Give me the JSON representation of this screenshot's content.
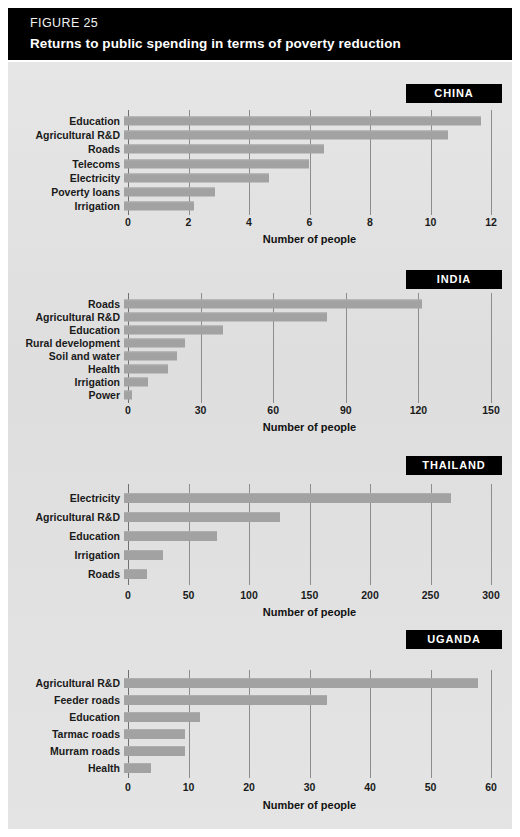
{
  "header": {
    "eyebrow": "FIGURE 25",
    "title": "Returns to public spending in terms of poverty reduction",
    "background_color": "#000000",
    "text_color": "#ffffff"
  },
  "style": {
    "bar_color": "#a2a2a2",
    "plate_background": "#e3e3e3",
    "gridline_color": "#8d8d8d",
    "badge_background": "#000000",
    "badge_text_color": "#ffffff"
  },
  "axis_title": "Number of people",
  "panels": [
    {
      "id": "china",
      "badge": "CHINA",
      "axis_title": "Number of people",
      "ticks": [
        0,
        2,
        4,
        6,
        8,
        10,
        12
      ],
      "xmax": 12,
      "categories": [
        "Education",
        "Agricultural R&D",
        "Roads",
        "Telecoms",
        "Electricity",
        "Poverty loans",
        "Irrigation"
      ],
      "values": [
        11.8,
        10.7,
        6.6,
        6.1,
        4.8,
        3.0,
        2.3
      ]
    },
    {
      "id": "india",
      "badge": "INDIA",
      "axis_title": "Number of people",
      "ticks": [
        0,
        30,
        60,
        90,
        120,
        150
      ],
      "xmax": 150,
      "categories": [
        "Roads",
        "Agricultural R&D",
        "Education",
        "Rural development",
        "Soil and water",
        "Health",
        "Irrigation",
        "Power"
      ],
      "values": [
        123,
        84,
        41,
        25,
        22,
        18,
        10,
        3.5
      ]
    },
    {
      "id": "thailand",
      "badge": "THAILAND",
      "axis_title": "Number of people",
      "ticks": [
        0,
        50,
        100,
        150,
        200,
        250,
        300
      ],
      "xmax": 300,
      "categories": [
        "Electricity",
        "Agricultural R&D",
        "Education",
        "Irrigation",
        "Roads"
      ],
      "values": [
        270,
        129,
        77,
        32,
        19
      ]
    },
    {
      "id": "uganda",
      "badge": "UGANDA",
      "axis_title": "Number of people",
      "ticks": [
        0,
        10,
        20,
        30,
        40,
        50,
        60
      ],
      "xmax": 60,
      "categories": [
        "Agricultural R&D",
        "Feeder roads",
        "Education",
        "Tarmac roads",
        "Murram roads",
        "Health"
      ],
      "values": [
        58.5,
        33.5,
        12.5,
        10,
        10,
        4.5
      ]
    }
  ],
  "chart_data": {
    "type": "bar",
    "orientation": "horizontal",
    "title": "Returns to public spending in terms of poverty reduction",
    "subtitle": "FIGURE 25",
    "xlabel": "Number of people",
    "ylabel": "",
    "grid": "vertical",
    "legend": "none",
    "panels": [
      {
        "name": "CHINA",
        "categories": [
          "Education",
          "Agricultural R&D",
          "Roads",
          "Telecoms",
          "Electricity",
          "Poverty loans",
          "Irrigation"
        ],
        "values": [
          11.8,
          10.7,
          6.6,
          6.1,
          4.8,
          3.0,
          2.3
        ],
        "xlim": [
          0,
          12
        ],
        "xticks": [
          0,
          2,
          4,
          6,
          8,
          10,
          12
        ]
      },
      {
        "name": "INDIA",
        "categories": [
          "Roads",
          "Agricultural R&D",
          "Education",
          "Rural development",
          "Soil and water",
          "Health",
          "Irrigation",
          "Power"
        ],
        "values": [
          123,
          84,
          41,
          25,
          22,
          18,
          10,
          3.5
        ],
        "xlim": [
          0,
          150
        ],
        "xticks": [
          0,
          30,
          60,
          90,
          120,
          150
        ]
      },
      {
        "name": "THAILAND",
        "categories": [
          "Electricity",
          "Agricultural R&D",
          "Education",
          "Irrigation",
          "Roads"
        ],
        "values": [
          270,
          129,
          77,
          32,
          19
        ],
        "xlim": [
          0,
          300
        ],
        "xticks": [
          0,
          50,
          100,
          150,
          200,
          250,
          300
        ]
      },
      {
        "name": "UGANDA",
        "categories": [
          "Agricultural R&D",
          "Feeder roads",
          "Education",
          "Tarmac roads",
          "Murram roads",
          "Health"
        ],
        "values": [
          58.5,
          33.5,
          12.5,
          10,
          10,
          4.5
        ],
        "xlim": [
          0,
          60
        ],
        "xticks": [
          0,
          10,
          20,
          30,
          40,
          50,
          60
        ]
      }
    ]
  }
}
